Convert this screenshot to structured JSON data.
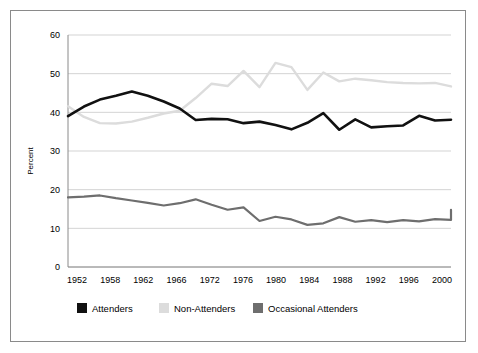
{
  "figure": {
    "border_color": "#8a8a8a",
    "background": "#ffffff"
  },
  "axis": {
    "ylabel": "Percent",
    "y_ticks": [
      "0",
      "10",
      "20",
      "30",
      "40",
      "50",
      "60"
    ],
    "x_ticks": [
      "1952",
      "1958",
      "1962",
      "1966",
      "1972",
      "1976",
      "1980",
      "1984",
      "1988",
      "1992",
      "1996",
      "2000"
    ]
  },
  "legend": {
    "items": [
      {
        "label": "Attenders",
        "color": "#111111"
      },
      {
        "label": "Non-Attenders",
        "color": "#dcdcdc"
      },
      {
        "label": "Occasional Attenders",
        "color": "#6e6e6e"
      }
    ]
  },
  "chart_data": {
    "type": "line",
    "title": "",
    "xlabel": "",
    "ylabel": "Percent",
    "xlim": [
      1952,
      2000
    ],
    "ylim": [
      0,
      60
    ],
    "grid": true,
    "legend_position": "bottom",
    "x_tick_labels": [
      "1952",
      "1958",
      "1962",
      "1966",
      "1972",
      "1976",
      "1980",
      "1984",
      "1988",
      "1992",
      "1996",
      "2000"
    ],
    "y_tick_values": [
      0,
      10,
      20,
      30,
      40,
      50,
      60
    ],
    "x": [
      1952,
      1954,
      1956,
      1958,
      1960,
      1962,
      1964,
      1966,
      1968,
      1970,
      1972,
      1974,
      1976,
      1978,
      1980,
      1982,
      1984,
      1986,
      1988,
      1990,
      1992,
      1994,
      1996,
      1998,
      2000
    ],
    "series": [
      {
        "name": "Attenders",
        "color": "#111111",
        "values": [
          39.0,
          41.5,
          43.3,
          44.3,
          45.4,
          44.3,
          42.8,
          41.0,
          38.0,
          38.3,
          38.2,
          37.2,
          37.6,
          36.7,
          35.6,
          37.3,
          39.8,
          35.5,
          38.2,
          36.1,
          36.4,
          36.6,
          39.1,
          37.9,
          38.1
        ]
      },
      {
        "name": "Non-Attenders",
        "color": "#dcdcdc",
        "values": [
          41.6,
          38.8,
          37.2,
          37.1,
          37.6,
          38.6,
          39.7,
          40.4,
          43.7,
          47.4,
          46.8,
          50.7,
          46.5,
          52.8,
          51.7,
          45.8,
          50.3,
          48.0,
          48.7,
          48.3,
          47.8,
          47.6,
          47.5,
          47.6,
          46.7
        ]
      },
      {
        "name": "Occasional Attenders",
        "color": "#6e6e6e",
        "values": [
          18.0,
          18.2,
          18.5,
          17.8,
          17.2,
          16.6,
          15.9,
          16.5,
          17.5,
          16.1,
          14.8,
          15.4,
          11.9,
          13.0,
          12.3,
          10.9,
          11.3,
          12.9,
          11.7,
          12.1,
          11.6,
          12.1,
          11.8,
          12.4,
          12.2
        ]
      }
    ],
    "occasional_tail": [
      12.2,
      14.8
    ]
  }
}
